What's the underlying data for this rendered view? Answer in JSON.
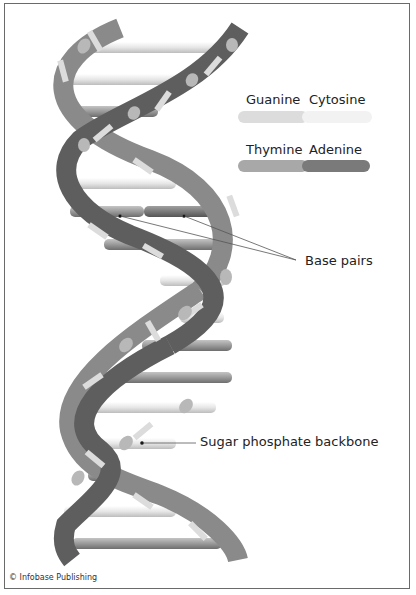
{
  "legend": {
    "pair1": {
      "left": "Guanine",
      "right": "Cytosine",
      "left_color": "#d9d9d9",
      "right_color": "#f0f0f0"
    },
    "pair2": {
      "left": "Thymine",
      "right": "Adenine",
      "left_color": "#a8a8a8",
      "right_color": "#7a7a7a"
    }
  },
  "callouts": {
    "base_pairs": "Base pairs",
    "backbone": "Sugar phosphate backbone"
  },
  "credit": "© Infobase Publishing",
  "colors": {
    "strand_dark": "#5e5e5e",
    "strand_mid": "#8a8a8a",
    "strand_light_band": "#dcdcdc",
    "frame": "#6a6a6a"
  }
}
